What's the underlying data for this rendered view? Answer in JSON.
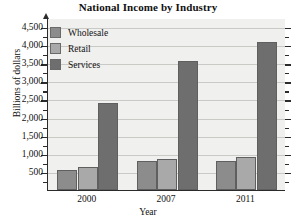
{
  "chart_data": {
    "type": "bar",
    "title": "National Income by Industry",
    "xlabel": "Year",
    "ylabel": "Billions of dollars",
    "categories": [
      "2000",
      "2007",
      "2011"
    ],
    "series": [
      {
        "name": "Wholesale",
        "color": "#8c8c8c",
        "values": [
          550,
          800,
          800
        ]
      },
      {
        "name": "Retail",
        "color": "#a9a9a9",
        "values": [
          640,
          850,
          900
        ]
      },
      {
        "name": "Services",
        "color": "#6e6e6e",
        "values": [
          2400,
          3550,
          4100
        ]
      }
    ],
    "ylim": [
      0,
      4750
    ],
    "yticks": [
      500,
      1000,
      1500,
      2000,
      2500,
      3000,
      3500,
      4000,
      4500
    ],
    "ytick_labels": [
      "500",
      "1,000",
      "1,500",
      "2,000",
      "2,500",
      "3,000",
      "3,500",
      "4,000",
      "4,500"
    ],
    "grid": true,
    "legend_position": "top-left",
    "plot_background": "#f0f0ee"
  },
  "axes": {
    "y_axis_title": "Billions of dollars",
    "x_axis_title": "Year"
  }
}
